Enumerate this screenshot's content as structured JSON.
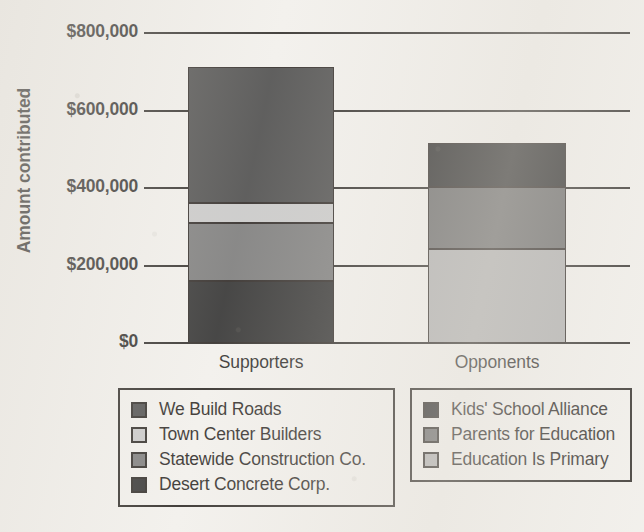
{
  "chart_data": {
    "type": "bar",
    "subtype": "stacked-bar",
    "title": "",
    "xlabel": "",
    "ylabel": "Amount contributed",
    "categories": [
      "Supporters",
      "Opponents"
    ],
    "ylim": [
      0,
      800000
    ],
    "ytick_labels": [
      "$800,000",
      "$600,000",
      "$400,000",
      "$200,000",
      "$0"
    ],
    "ytick_values": [
      800000,
      600000,
      400000,
      200000,
      0
    ],
    "grid": true,
    "legend_position": "below-plot",
    "series": [
      {
        "name": "We Build Roads",
        "group": "Supporters",
        "color": "#3a3a3a",
        "values": [
          350000,
          0
        ]
      },
      {
        "name": "Town Center Builders",
        "group": "Supporters",
        "color": "#c4c4c4",
        "values": [
          52000,
          0
        ]
      },
      {
        "name": "Statewide Construction Co.",
        "group": "Supporters",
        "color": "#6e6e6e",
        "values": [
          150000,
          0
        ]
      },
      {
        "name": "Desert Concrete Corp.",
        "group": "Supporters",
        "color": "#1c1c1c",
        "values": [
          160000,
          0
        ]
      },
      {
        "name": "Kids' School Alliance",
        "group": "Opponents",
        "color": "#141414",
        "values": [
          0,
          113000
        ]
      },
      {
        "name": "Parents for Education",
        "group": "Opponents",
        "color": "#5a5a5a",
        "values": [
          0,
          160000
        ]
      },
      {
        "name": "Education Is Primary",
        "group": "Opponents",
        "color": "#a8a8a8",
        "values": [
          0,
          242000
        ]
      }
    ],
    "totals": {
      "Supporters": 712000,
      "Opponents": 515000
    }
  },
  "axis": {
    "y_title": "Amount contributed",
    "y_ticks": [
      {
        "label": "$800,000",
        "value": 800000
      },
      {
        "label": "$600,000",
        "value": 600000
      },
      {
        "label": "$400,000",
        "value": 400000
      },
      {
        "label": "$200,000",
        "value": 200000
      },
      {
        "label": "$0",
        "value": 0
      }
    ],
    "x_ticks": [
      {
        "label": "Supporters"
      },
      {
        "label": "Opponents"
      }
    ]
  },
  "bars": {
    "supporters": {
      "label": "Supporters",
      "segments": [
        {
          "name": "Desert Concrete Corp.",
          "value": 160000,
          "color": "#1c1c1c"
        },
        {
          "name": "Statewide Construction Co.",
          "value": 150000,
          "color": "#6e6e6e"
        },
        {
          "name": "Town Center Builders",
          "value": 52000,
          "color": "#c4c4c4"
        },
        {
          "name": "We Build Roads",
          "value": 350000,
          "color": "#3a3a3a"
        }
      ]
    },
    "opponents": {
      "label": "Opponents",
      "segments": [
        {
          "name": "Education Is Primary",
          "value": 242000,
          "color": "#a8a8a8"
        },
        {
          "name": "Parents for Education",
          "value": 160000,
          "color": "#5a5a5a"
        },
        {
          "name": "Kids' School Alliance",
          "value": 113000,
          "color": "#141414"
        }
      ]
    }
  },
  "legend_left": {
    "items": [
      {
        "label": "We Build Roads",
        "color": "#3a3a3a"
      },
      {
        "label": "Town Center Builders",
        "color": "#c4c4c4"
      },
      {
        "label": "Statewide Construction Co.",
        "color": "#6e6e6e"
      },
      {
        "label": "Desert Concrete Corp.",
        "color": "#1c1c1c"
      }
    ]
  },
  "legend_right": {
    "items": [
      {
        "label": "Kids' School Alliance",
        "color": "#141414"
      },
      {
        "label": "Parents for Education",
        "color": "#5a5a5a"
      },
      {
        "label": "Education Is Primary",
        "color": "#a8a8a8"
      }
    ]
  }
}
